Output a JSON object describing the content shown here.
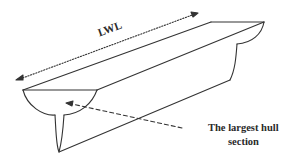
{
  "diagram": {
    "type": "hull-isometric-sketch",
    "labels": {
      "lwl": "LWL",
      "section_line1": "The largest hull",
      "section_line2": "section"
    },
    "colors": {
      "line": "#333333",
      "text": "#2a2a2a",
      "background": "#ffffff"
    }
  }
}
